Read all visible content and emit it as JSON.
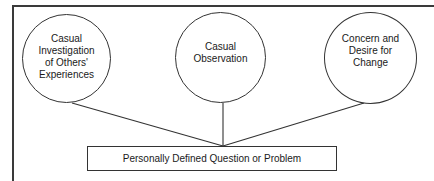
{
  "diagram": {
    "type": "convergence",
    "sources": [
      {
        "id": "c1",
        "label": "Casual\nInvestigation\nof Others'\nExperiences"
      },
      {
        "id": "c2",
        "label": "Casual\nObservation"
      },
      {
        "id": "c3",
        "label": "Concern and\nDesire for\nChange"
      }
    ],
    "target": {
      "label": "Personally Defined Question or Problem"
    },
    "edges": [
      {
        "from": "c1",
        "to": "target"
      },
      {
        "from": "c2",
        "to": "target"
      },
      {
        "from": "c3",
        "to": "target"
      }
    ],
    "colors": {
      "stroke": "#333333",
      "frame": "#3a3a3a",
      "background": "#ffffff"
    }
  }
}
